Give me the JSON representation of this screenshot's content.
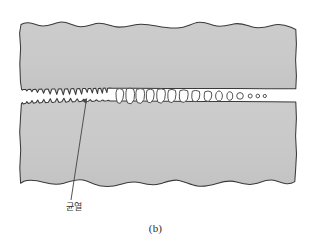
{
  "figure": {
    "caption": "(b)",
    "panel_id": "b",
    "label_crack": "균열",
    "label_crack_meaning": "crack",
    "colors": {
      "material_fill": "#c9c9c9",
      "material_fill_shade": "#c2c2c2",
      "outline": "#3a3a3a",
      "void_fill": "#ffffff",
      "void_outline": "#4a4a4a",
      "leader_line": "#4a4a4a",
      "background": "#ffffff",
      "caption_text": "#2b2b2b",
      "label_text": "#333333"
    },
    "geometry": {
      "material_block": {
        "left": 18,
        "top": 20,
        "right": 297,
        "bottom": 196,
        "edge_style": "irregular-wavy-torn"
      },
      "crack_axis_y": 96,
      "crack_mouth_x": 20,
      "crack_tip_x": 87,
      "crack_profile": "jagged-sawtooth-tapering-right",
      "void_train_start_x": 116,
      "void_train_end_x": 266
    },
    "voids": [
      {
        "cx": 120,
        "cy": 96,
        "rx": 4.0,
        "ry": 8.0,
        "shape": "irregular-polygon"
      },
      {
        "cx": 130,
        "cy": 96,
        "rx": 4.2,
        "ry": 8.6,
        "shape": "irregular-polygon"
      },
      {
        "cx": 140,
        "cy": 96,
        "rx": 4.0,
        "ry": 8.2,
        "shape": "rounded-rect"
      },
      {
        "cx": 150,
        "cy": 96,
        "rx": 3.6,
        "ry": 7.4,
        "shape": "rounded-rect"
      },
      {
        "cx": 161,
        "cy": 96,
        "rx": 4.0,
        "ry": 7.8,
        "shape": "irregular-polygon"
      },
      {
        "cx": 172,
        "cy": 96,
        "rx": 3.8,
        "ry": 7.2,
        "shape": "rounded-rect"
      },
      {
        "cx": 184,
        "cy": 96,
        "rx": 4.2,
        "ry": 7.0,
        "shape": "rounded-rect"
      },
      {
        "cx": 196,
        "cy": 96,
        "rx": 3.8,
        "ry": 6.4,
        "shape": "ellipse"
      },
      {
        "cx": 208,
        "cy": 96,
        "rx": 3.6,
        "ry": 5.8,
        "shape": "ellipse"
      },
      {
        "cx": 219,
        "cy": 96,
        "rx": 3.2,
        "ry": 5.0,
        "shape": "ellipse"
      },
      {
        "cx": 230,
        "cy": 96,
        "rx": 2.8,
        "ry": 4.2,
        "shape": "ellipse"
      },
      {
        "cx": 240,
        "cy": 96,
        "rx": 3.2,
        "ry": 4.0,
        "shape": "circle"
      },
      {
        "cx": 250,
        "cy": 96,
        "rx": 2.0,
        "ry": 2.0,
        "shape": "circle"
      },
      {
        "cx": 258,
        "cy": 96,
        "rx": 1.8,
        "ry": 1.8,
        "shape": "circle"
      },
      {
        "cx": 265,
        "cy": 96,
        "rx": 1.6,
        "ry": 1.6,
        "shape": "circle"
      }
    ],
    "leader": {
      "from_x": 86,
      "from_y": 100,
      "to_x": 71,
      "to_y": 200,
      "arrow_at": "from",
      "arrow_target": "crack-tip"
    }
  }
}
